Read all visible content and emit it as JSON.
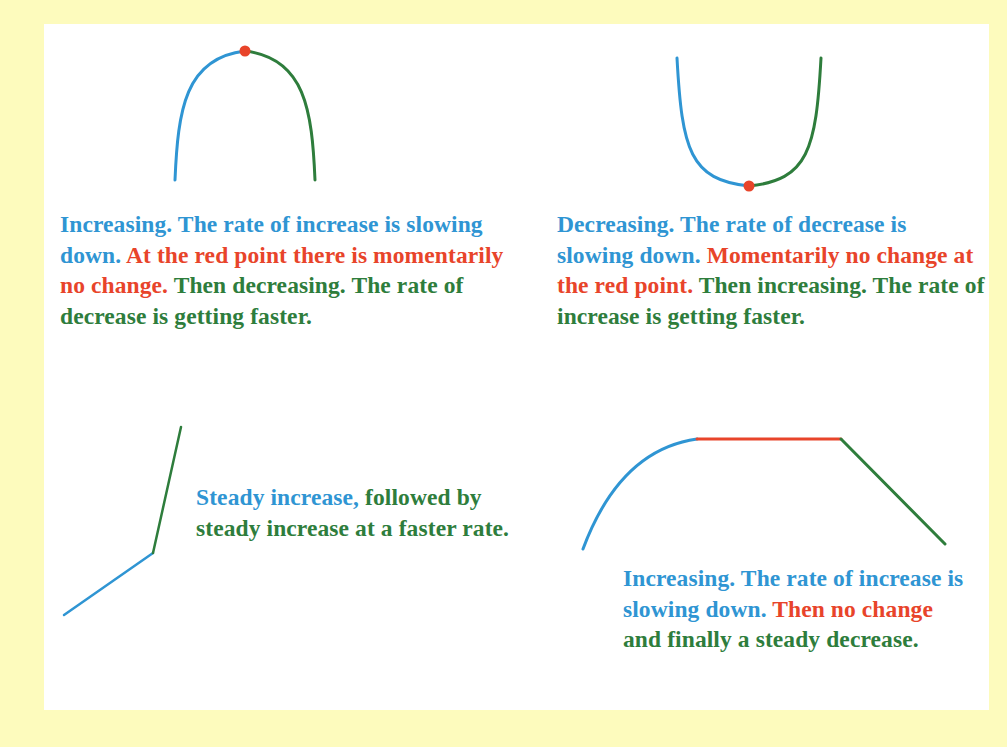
{
  "colors": {
    "background": "#fdfbbd",
    "panel": "#ffffff",
    "blue": "#2f95d3",
    "red": "#e8442a",
    "green": "#2e7d3c"
  },
  "panels": [
    {
      "id": "maximum",
      "graph_shape": "concave-down curve with a maximum point",
      "segments": [
        "increasing (blue)",
        "maximum point (red dot)",
        "decreasing (green)"
      ],
      "caption": {
        "blue": "Increasing. The rate of increase is slowing down.",
        "red": "At the red point there is momentarily no change.",
        "green": "Then decreasing. The rate of decrease is getting faster."
      }
    },
    {
      "id": "minimum",
      "graph_shape": "concave-up curve with a minimum point",
      "segments": [
        "decreasing (blue)",
        "minimum point (red dot)",
        "increasing (green)"
      ],
      "caption": {
        "blue": "Decreasing. The rate of decrease is slowing down.",
        "red": "Momentarily no change at the red point.",
        "green": "Then increasing. The rate of increase is getting faster."
      }
    },
    {
      "id": "steady-increase",
      "graph_shape": "two straight line segments, second steeper",
      "segments": [
        "steady increase (blue)",
        "faster steady increase (green)"
      ],
      "caption": {
        "blue": "Steady increase,",
        "green": "followed by steady increase at a faster rate."
      }
    },
    {
      "id": "plateau",
      "graph_shape": "curve rising then flat then straight decline",
      "segments": [
        "increasing, slowing (blue)",
        "no change (red)",
        "steady decrease (green)"
      ],
      "caption": {
        "blue": "Increasing. The rate of increase is slowing down.",
        "red": "Then no change",
        "green": "and finally a steady decrease."
      }
    }
  ]
}
